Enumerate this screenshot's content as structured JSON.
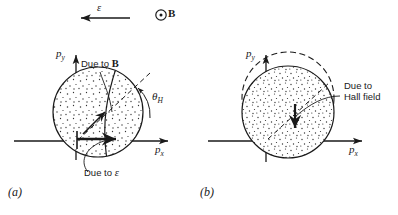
{
  "figure": {
    "top_annotation": {
      "field_arrow_label": "ε",
      "field_arrow_direction": "left",
      "magnetic_symbol": "⊙",
      "magnetic_label": "B"
    },
    "panels": [
      {
        "id": "a",
        "caption": "(a)",
        "axis_x_label": "p",
        "axis_x_sub": "x",
        "axis_y_label": "p",
        "axis_y_sub": "y",
        "annotations": [
          {
            "name": "due-to-b",
            "text": "Due to ",
            "symbol": "B"
          },
          {
            "name": "due-to-epsilon",
            "text": "Due to ",
            "symbol": "ε"
          },
          {
            "name": "hall-angle",
            "text": "θ",
            "sub": "H"
          }
        ],
        "description": "Fermi sphere displaced by electric field and magnetic field, Hall angle theta-H between displacement direction and p-x axis"
      },
      {
        "id": "b",
        "caption": "(b)",
        "axis_x_label": "p",
        "axis_x_sub": "x",
        "axis_y_label": "p",
        "axis_y_sub": "y",
        "annotations": [
          {
            "name": "due-to-hall-field",
            "line1": "Due to",
            "line2": "Hall field"
          }
        ],
        "description": "Fermi sphere with dashed circle offset upward restored downward by the Hall field"
      }
    ],
    "colors": {
      "ink": "#1a1a1a",
      "background": "#ffffff",
      "stipple": "#3a3a3a"
    }
  }
}
